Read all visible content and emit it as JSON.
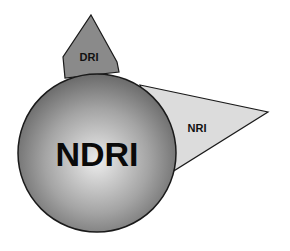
{
  "diagram": {
    "center": {
      "label": "NDRI",
      "fill_center": "#e8e8e8",
      "fill_edge": "#6e6e6e"
    },
    "top_shape": {
      "label": "DRI",
      "fill": "#8a8a8a"
    },
    "right_shape": {
      "label": "NRI",
      "fill": "#dcdcdc"
    },
    "stroke": "#1a1a1a"
  }
}
